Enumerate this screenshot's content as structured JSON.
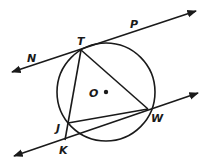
{
  "diagram": {
    "type": "geometry",
    "stroke_color": "#1a1a1a",
    "circle": {
      "center_label": "O",
      "cx": 106,
      "cy": 92,
      "r": 49
    },
    "points": {
      "T": {
        "label": "T",
        "x": 81,
        "y": 50
      },
      "W": {
        "label": "W",
        "x": 148,
        "y": 109
      },
      "J": {
        "label": "J",
        "x": 68,
        "y": 123
      },
      "K": {
        "label": "K",
        "x": 65,
        "y": 140
      },
      "O": {
        "label": "O",
        "x": 106,
        "y": 92
      }
    },
    "lines": {
      "NP": {
        "from_label": "N",
        "to_label": "P",
        "x1": 12,
        "y1": 72,
        "x2": 196,
        "y2": 11,
        "arrows": "both",
        "tangent_at": "T"
      },
      "KW": {
        "x1": 14,
        "y1": 156,
        "x2": 198,
        "y2": 93,
        "arrows": "both",
        "through": [
          "K",
          "W"
        ]
      }
    },
    "segments": [
      {
        "name": "TW",
        "from": "T",
        "to": "W"
      },
      {
        "name": "TK",
        "from": "T",
        "to": "K"
      },
      {
        "name": "JW",
        "from": "J",
        "to": "W"
      }
    ],
    "labels": {
      "N": "N",
      "P": "P",
      "T": "T",
      "O": "O",
      "J": "J",
      "W": "W",
      "K": "K"
    }
  }
}
